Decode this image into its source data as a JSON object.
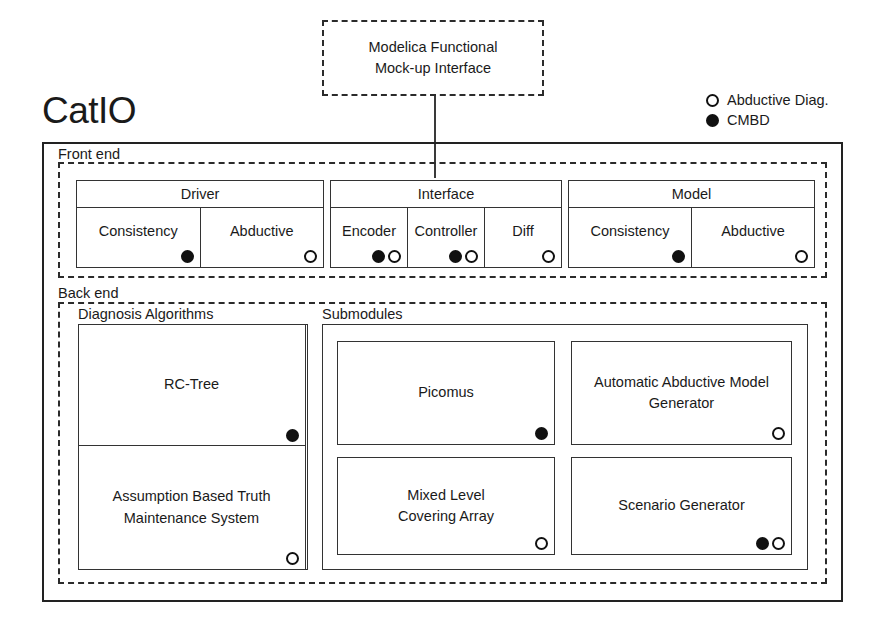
{
  "title": "CatIO",
  "external": {
    "fmi_label": "Modelica Functional\nMock-up Interface"
  },
  "legend": {
    "items": [
      {
        "marker": "hollow",
        "label": "Abductive Diag."
      },
      {
        "marker": "filled",
        "label": "CMBD"
      }
    ]
  },
  "frontend": {
    "label": "Front end",
    "groups": [
      {
        "title": "Driver",
        "cells": [
          {
            "label": "Consistency",
            "markers": [
              "filled"
            ]
          },
          {
            "label": "Abductive",
            "markers": [
              "hollow"
            ]
          }
        ]
      },
      {
        "title": "Interface",
        "cells": [
          {
            "label": "Encoder",
            "markers": [
              "filled",
              "hollow"
            ]
          },
          {
            "label": "Controller",
            "markers": [
              "filled",
              "hollow"
            ]
          },
          {
            "label": "Diff",
            "markers": [
              "hollow"
            ]
          }
        ]
      },
      {
        "title": "Model",
        "cells": [
          {
            "label": "Consistency",
            "markers": [
              "filled"
            ]
          },
          {
            "label": "Abductive",
            "markers": [
              "hollow"
            ]
          }
        ]
      }
    ]
  },
  "backend": {
    "label": "Back end",
    "groups": [
      {
        "label": "Diagnosis Algorithms",
        "cells": [
          {
            "label": "RC-Tree",
            "markers": [
              "filled"
            ]
          },
          {
            "label": "Assumption Based Truth\nMaintenance System",
            "markers": [
              "hollow"
            ]
          }
        ]
      },
      {
        "label": "Submodules",
        "cells": [
          {
            "label": "Picomus",
            "markers": [
              "filled"
            ]
          },
          {
            "label": "Automatic Abductive Model\nGenerator",
            "markers": [
              "hollow"
            ]
          },
          {
            "label": "Mixed Level\nCovering Array",
            "markers": [
              "hollow"
            ]
          },
          {
            "label": "Scenario Generator",
            "markers": [
              "filled",
              "hollow"
            ]
          }
        ]
      }
    ]
  }
}
